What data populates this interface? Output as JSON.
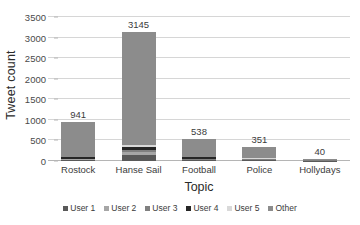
{
  "chart_data": {
    "type": "bar",
    "subtype": "stacked-column",
    "title": "",
    "xlabel": "Topic",
    "ylabel": "Tweet count",
    "categories": [
      "Rostock",
      "Hanse Sail",
      "Football",
      "Police",
      "Hollydays"
    ],
    "totals": [
      941,
      3145,
      538,
      351,
      40
    ],
    "total_labels": [
      "941",
      "3145",
      "538",
      "351",
      "40"
    ],
    "series": [
      {
        "name": "User 1",
        "color": "#595959",
        "values": [
          22,
          150,
          18,
          8,
          1
        ]
      },
      {
        "name": "User 2",
        "color": "#a6a6a6",
        "values": [
          18,
          60,
          14,
          6,
          1
        ]
      },
      {
        "name": "User 3",
        "color": "#808080",
        "values": [
          20,
          55,
          16,
          7,
          1
        ]
      },
      {
        "name": "User 4",
        "color": "#262626",
        "values": [
          28,
          75,
          40,
          10,
          1
        ]
      },
      {
        "name": "User 5",
        "color": "#d9d9d9",
        "values": [
          16,
          45,
          12,
          6,
          1
        ]
      },
      {
        "name": "Other",
        "color": "#8c8c8c",
        "values": [
          837,
          2760,
          438,
          314,
          35
        ]
      }
    ],
    "yticks": [
      0,
      500,
      1000,
      1500,
      2000,
      2500,
      3000,
      3500
    ],
    "ytick_labels": [
      "0",
      "500",
      "1000",
      "1500",
      "2000",
      "2500",
      "3000",
      "3500"
    ],
    "ylim": [
      0,
      3500
    ],
    "grid": true,
    "legend_position": "bottom",
    "legend_entries": [
      "User 1",
      "User 2",
      "User 3",
      "User 4",
      "User 5",
      "Other"
    ],
    "background_color": "#ffffff",
    "gridline_color": "#d6d6d6",
    "text_color": "#3b3b3b"
  }
}
